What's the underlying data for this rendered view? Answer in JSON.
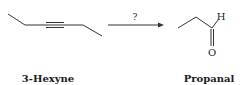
{
  "reactant": {
    "name": "3-Hexyne"
  },
  "reagent": {
    "label": "?"
  },
  "product": {
    "name": "Propanal",
    "atoms": {
      "hydrogen": "H",
      "oxygen": "O"
    }
  },
  "colors": {
    "ink": "#1a1a1a",
    "bond": "#333333"
  }
}
